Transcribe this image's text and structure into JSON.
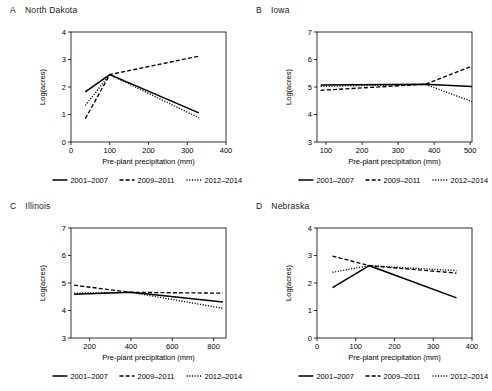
{
  "figure": {
    "axis_x_label": "Pre-plant precipitation (mm)",
    "axis_y_label": "Log(acres)",
    "line_color": "#000000",
    "background_color": "#ffffff"
  },
  "legend": {
    "items": [
      {
        "label": "2001–2007",
        "style": "solid"
      },
      {
        "label": "2009–2011",
        "style": "dashed"
      },
      {
        "label": "2012–2014",
        "style": "dotted"
      }
    ]
  },
  "panels": [
    {
      "letter": "A",
      "title": "North Dakota",
      "chart_data": {
        "type": "line",
        "title": "North Dakota",
        "xlabel": "Pre-plant precipitation (mm)",
        "ylabel": "Log(acres)",
        "xlim": [
          0,
          400
        ],
        "ylim": [
          0,
          4
        ],
        "xticks": [
          0,
          100,
          200,
          300,
          400
        ],
        "yticks": [
          0,
          1,
          2,
          3,
          4
        ],
        "grid": false,
        "legend_position": "below",
        "series": [
          {
            "name": "2001–2007",
            "style": "solid",
            "x": [
              37,
              100,
              330
            ],
            "values": [
              1.82,
              2.45,
              1.06
            ]
          },
          {
            "name": "2009–2011",
            "style": "dashed",
            "x": [
              37,
              100,
              330
            ],
            "values": [
              0.85,
              2.45,
              3.12
            ]
          },
          {
            "name": "2012–2014",
            "style": "dotted",
            "x": [
              37,
              100,
              330
            ],
            "values": [
              1.33,
              2.45,
              0.88
            ]
          }
        ]
      }
    },
    {
      "letter": "B",
      "title": "Iowa",
      "chart_data": {
        "type": "line",
        "title": "Iowa",
        "xlabel": "Pre-plant precipitation (mm)",
        "ylabel": "Log(acres)",
        "xlim": [
          75,
          505
        ],
        "ylim": [
          3,
          7
        ],
        "xticks": [
          100,
          200,
          300,
          400,
          500
        ],
        "yticks": [
          3,
          4,
          5,
          6,
          7
        ],
        "grid": false,
        "legend_position": "below",
        "series": [
          {
            "name": "2001–2007",
            "style": "solid",
            "x": [
              85,
              375,
              505
            ],
            "values": [
              5.07,
              5.1,
              5.02
            ]
          },
          {
            "name": "2009–2011",
            "style": "dashed",
            "x": [
              85,
              375,
              505
            ],
            "values": [
              4.88,
              5.1,
              5.76
            ]
          },
          {
            "name": "2012–2014",
            "style": "dotted",
            "x": [
              85,
              375,
              505
            ],
            "values": [
              5.02,
              5.1,
              4.47
            ]
          }
        ]
      }
    },
    {
      "letter": "C",
      "title": "Illinois",
      "chart_data": {
        "type": "line",
        "title": "Illinois",
        "xlabel": "Pre-plant precipitation (mm)",
        "ylabel": "Log(acres)",
        "xlim": [
          110,
          860
        ],
        "ylim": [
          3,
          7
        ],
        "xticks": [
          200,
          400,
          600,
          800
        ],
        "yticks": [
          3,
          4,
          5,
          6,
          7
        ],
        "grid": false,
        "legend_position": "below",
        "series": [
          {
            "name": "2001–2007",
            "style": "solid",
            "x": [
              125,
              400,
              845
            ],
            "values": [
              4.59,
              4.66,
              4.31
            ]
          },
          {
            "name": "2009–2011",
            "style": "dashed",
            "x": [
              125,
              400,
              845
            ],
            "values": [
              4.92,
              4.66,
              4.63
            ]
          },
          {
            "name": "2012–2014",
            "style": "dotted",
            "x": [
              125,
              400,
              845
            ],
            "values": [
              4.63,
              4.66,
              4.08
            ]
          }
        ]
      }
    },
    {
      "letter": "D",
      "title": "Nebraska",
      "chart_data": {
        "type": "line",
        "title": "Nebraska",
        "xlabel": "Pre-plant precipitation (mm)",
        "ylabel": "Log(acres)",
        "xlim": [
          0,
          400
        ],
        "ylim": [
          0,
          4
        ],
        "xticks": [
          0,
          100,
          200,
          300,
          400
        ],
        "yticks": [
          0,
          1,
          2,
          3,
          4
        ],
        "grid": false,
        "legend_position": "below",
        "series": [
          {
            "name": "2001–2007",
            "style": "solid",
            "x": [
              40,
              135,
              360
            ],
            "values": [
              1.83,
              2.63,
              1.46
            ]
          },
          {
            "name": "2009–2011",
            "style": "dashed",
            "x": [
              40,
              135,
              360
            ],
            "values": [
              2.98,
              2.63,
              2.36
            ]
          },
          {
            "name": "2012–2014",
            "style": "dotted",
            "x": [
              40,
              135,
              360
            ],
            "values": [
              2.39,
              2.63,
              2.45
            ]
          }
        ]
      }
    }
  ]
}
